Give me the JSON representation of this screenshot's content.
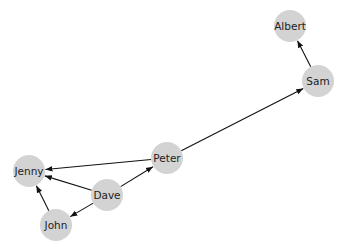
{
  "diagram": {
    "type": "directed-graph",
    "node_color": "#d3d3d3",
    "edge_color": "#111111",
    "node_radius": 16,
    "nodes": [
      {
        "id": "Albert",
        "label": "Albert",
        "x": 290,
        "y": 26
      },
      {
        "id": "Sam",
        "label": "Sam",
        "x": 318,
        "y": 81
      },
      {
        "id": "Peter",
        "label": "Peter",
        "x": 167,
        "y": 158
      },
      {
        "id": "Dave",
        "label": "Dave",
        "x": 107,
        "y": 195
      },
      {
        "id": "Jenny",
        "label": "Jenny",
        "x": 29,
        "y": 171
      },
      {
        "id": "John",
        "label": "John",
        "x": 56,
        "y": 225
      }
    ],
    "edges": [
      {
        "source": "Sam",
        "target": "Albert"
      },
      {
        "source": "Peter",
        "target": "Sam"
      },
      {
        "source": "Peter",
        "target": "Jenny"
      },
      {
        "source": "Dave",
        "target": "Peter"
      },
      {
        "source": "Dave",
        "target": "Jenny"
      },
      {
        "source": "Dave",
        "target": "John"
      },
      {
        "source": "John",
        "target": "Jenny"
      }
    ]
  }
}
